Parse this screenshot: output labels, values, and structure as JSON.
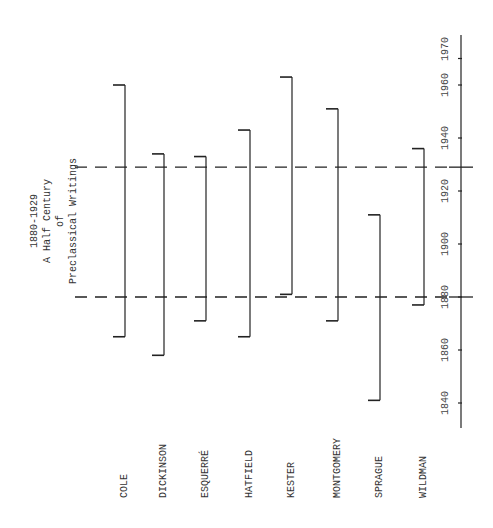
{
  "title": {
    "line1": "1880-1929",
    "line2": "A Half Century",
    "line3": "of",
    "line4": "Preclassical Writings"
  },
  "axis": {
    "ticks": [
      {
        "label": "1840",
        "year": 1840
      },
      {
        "label": "1860",
        "year": 1860
      },
      {
        "label": "1880",
        "year": 1880
      },
      {
        "label": "1900",
        "year": 1900
      },
      {
        "label": "1920",
        "year": 1920
      },
      {
        "label": "1940",
        "year": 1940
      },
      {
        "label": "1960",
        "year": 1960
      },
      {
        "label": "1970",
        "year": 1970
      }
    ]
  },
  "reference_lines": [
    {
      "year": 1880,
      "style": "dashed"
    },
    {
      "year": 1929,
      "style": "dashed"
    }
  ],
  "authors": [
    {
      "name": "COLE",
      "start": 1865,
      "end": 1960
    },
    {
      "name": "DICKINSON",
      "start": 1858,
      "end": 1934
    },
    {
      "name": "ESQUERRÉ",
      "start": 1871,
      "end": 1933
    },
    {
      "name": "HATFIELD",
      "start": 1865,
      "end": 1943
    },
    {
      "name": "KESTER",
      "start": 1881,
      "end": 1963
    },
    {
      "name": "MONTGOMERY",
      "start": 1871,
      "end": 1951
    },
    {
      "name": "SPRAGUE",
      "start": 1841,
      "end": 1911
    },
    {
      "name": "WILDMAN",
      "start": 1877,
      "end": 1936
    }
  ],
  "chart_data": {
    "type": "timeline",
    "title": "1880-1929 A Half Century of Preclassical Writings",
    "orientation": "rotated 90° (years increase upward)",
    "axis_range": [
      1835,
      1975
    ],
    "axis_ticks": [
      1840,
      1860,
      1880,
      1900,
      1920,
      1940,
      1960,
      1970
    ],
    "reference_years": [
      1880,
      1929
    ],
    "categories": [
      "COLE",
      "DICKINSON",
      "ESQUERRÉ",
      "HATFIELD",
      "KESTER",
      "MONTGOMERY",
      "SPRAGUE",
      "WILDMAN"
    ],
    "series": [
      {
        "name": "lifespan_start",
        "values": [
          1865,
          1858,
          1871,
          1865,
          1881,
          1871,
          1841,
          1877
        ]
      },
      {
        "name": "lifespan_end",
        "values": [
          1960,
          1934,
          1933,
          1943,
          1963,
          1951,
          1911,
          1936
        ]
      }
    ]
  }
}
